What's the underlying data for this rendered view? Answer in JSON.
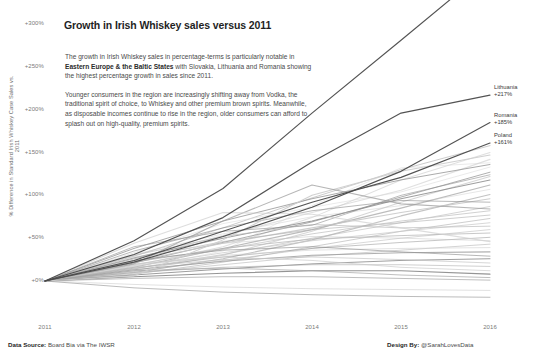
{
  "chart_data": {
    "type": "line",
    "title": "Growth in Irish Whiskey sales versus 2011",
    "xlabel": "",
    "ylabel": "% Difference in Standard Irish Whiskey Case Sales vs. 2011",
    "x": [
      2011,
      2012,
      2013,
      2014,
      2015,
      2016
    ],
    "xticklabels": [
      "2011",
      "2012",
      "2013",
      "2014",
      "2015",
      "2016"
    ],
    "yticklabels": [
      "+0%",
      "+50%",
      "+100%",
      "+150%",
      "+200%",
      "+250%",
      "+300%"
    ],
    "ytickvalues": [
      0,
      50,
      100,
      150,
      200,
      250,
      300
    ],
    "ylim": [
      -25,
      380
    ],
    "xlim": [
      2011,
      2016
    ],
    "grid": false,
    "legend": "series end labels at right",
    "annotation_paragraphs": [
      "The growth in Irish Whiskey sales in percentage-terms is particularly notable in Eastern Europe & the Baltic States with Slovakia, Lithuania and Romania showing the highest percentage growth in sales since 2011.",
      "Younger consumers in the region are increasingly shifting away from Vodka, the traditional spirit of choice, to Whiskey and other premium brown spirits. Meanwhile, as disposable incomes continue to rise in the region, older consumers can afford to splash out on high-quality, premium spirits."
    ],
    "highlight_color": "#4a4a4a",
    "muted_color": "#b8b8b8",
    "series": [
      {
        "name": "Slovakia",
        "label": "Slovakia",
        "value_label": "+367%",
        "highlight": true,
        "values": [
          0,
          47,
          108,
          196,
          281,
          367
        ]
      },
      {
        "name": "Lithuania",
        "label": "Lithuania",
        "value_label": "+217%",
        "highlight": true,
        "values": [
          0,
          31,
          74,
          139,
          196,
          217
        ]
      },
      {
        "name": "Romania",
        "label": "Romania",
        "value_label": "+185%",
        "highlight": true,
        "values": [
          0,
          22,
          52,
          86,
          128,
          185
        ]
      },
      {
        "name": "Poland",
        "label": "Poland",
        "value_label": "+161%",
        "highlight": true,
        "values": [
          0,
          24,
          58,
          92,
          121,
          161
        ]
      },
      {
        "name": "series-05",
        "highlight": false,
        "values": [
          0,
          29,
          62,
          97,
          130,
          158
        ]
      },
      {
        "name": "series-06",
        "highlight": false,
        "values": [
          0,
          18,
          40,
          74,
          118,
          150
        ]
      },
      {
        "name": "series-07",
        "highlight": false,
        "values": [
          0,
          26,
          53,
          80,
          106,
          142
        ]
      },
      {
        "name": "series-08",
        "highlight": false,
        "values": [
          0,
          14,
          35,
          88,
          132,
          138
        ]
      },
      {
        "name": "series-09",
        "highlight": false,
        "values": [
          0,
          33,
          67,
          86,
          104,
          133
        ]
      },
      {
        "name": "series-10",
        "highlight": false,
        "values": [
          0,
          21,
          45,
          69,
          98,
          127
        ]
      },
      {
        "name": "series-11",
        "highlight": false,
        "values": [
          0,
          12,
          30,
          58,
          92,
          122
        ]
      },
      {
        "name": "series-12",
        "highlight": false,
        "values": [
          0,
          27,
          50,
          70,
          96,
          118
        ]
      },
      {
        "name": "series-13",
        "highlight": false,
        "values": [
          0,
          16,
          38,
          60,
          85,
          112
        ]
      },
      {
        "name": "series-14",
        "highlight": false,
        "values": [
          0,
          31,
          55,
          75,
          88,
          107
        ]
      },
      {
        "name": "series-15",
        "highlight": false,
        "values": [
          0,
          10,
          26,
          48,
          76,
          101
        ]
      },
      {
        "name": "series-16",
        "highlight": false,
        "values": [
          0,
          23,
          44,
          62,
          80,
          96
        ]
      },
      {
        "name": "series-17",
        "highlight": false,
        "values": [
          0,
          35,
          62,
          82,
          94,
          92
        ]
      },
      {
        "name": "series-18",
        "highlight": false,
        "values": [
          0,
          14,
          31,
          50,
          68,
          87
        ]
      },
      {
        "name": "series-19",
        "highlight": false,
        "values": [
          0,
          19,
          37,
          55,
          70,
          82
        ]
      },
      {
        "name": "series-20",
        "highlight": false,
        "values": [
          0,
          26,
          46,
          60,
          68,
          77
        ]
      },
      {
        "name": "series-21",
        "highlight": false,
        "values": [
          0,
          8,
          22,
          40,
          58,
          73
        ]
      },
      {
        "name": "series-22",
        "highlight": false,
        "values": [
          0,
          17,
          33,
          47,
          58,
          68
        ]
      },
      {
        "name": "series-23",
        "highlight": false,
        "values": [
          0,
          30,
          52,
          66,
          62,
          64
        ]
      },
      {
        "name": "series-24",
        "highlight": false,
        "values": [
          0,
          11,
          24,
          38,
          50,
          60
        ]
      },
      {
        "name": "series-25",
        "highlight": false,
        "values": [
          0,
          22,
          38,
          49,
          53,
          56
        ]
      },
      {
        "name": "series-26",
        "highlight": false,
        "values": [
          0,
          15,
          28,
          38,
          45,
          51
        ]
      },
      {
        "name": "series-27",
        "highlight": false,
        "values": [
          0,
          28,
          44,
          52,
          50,
          47
        ]
      },
      {
        "name": "series-28",
        "highlight": false,
        "values": [
          0,
          9,
          19,
          29,
          36,
          43
        ]
      },
      {
        "name": "series-29",
        "highlight": false,
        "values": [
          0,
          18,
          30,
          36,
          38,
          39
        ]
      },
      {
        "name": "series-30",
        "highlight": false,
        "values": [
          0,
          13,
          23,
          30,
          33,
          34
        ]
      },
      {
        "name": "series-31",
        "highlight": false,
        "values": [
          0,
          24,
          36,
          40,
          34,
          29
        ]
      },
      {
        "name": "series-32",
        "highlight": false,
        "values": [
          0,
          7,
          14,
          20,
          24,
          26
        ]
      },
      {
        "name": "series-33",
        "highlight": false,
        "values": [
          0,
          16,
          25,
          28,
          25,
          21
        ]
      },
      {
        "name": "series-34",
        "highlight": false,
        "values": [
          0,
          10,
          16,
          19,
          19,
          17
        ]
      },
      {
        "name": "series-35",
        "highlight": false,
        "values": [
          0,
          20,
          28,
          24,
          16,
          12
        ]
      },
      {
        "name": "series-36",
        "highlight": false,
        "values": [
          0,
          5,
          9,
          12,
          12,
          8
        ]
      },
      {
        "name": "series-37",
        "highlight": false,
        "values": [
          0,
          12,
          15,
          12,
          7,
          4
        ]
      },
      {
        "name": "series-38",
        "highlight": false,
        "values": [
          0,
          3,
          5,
          5,
          3,
          1
        ]
      },
      {
        "name": "series-39",
        "highlight": false,
        "values": [
          0,
          -4,
          -7,
          -9,
          -10,
          -11
        ]
      },
      {
        "name": "series-40",
        "highlight": false,
        "values": [
          0,
          -8,
          -13,
          -16,
          -18,
          -19
        ]
      },
      {
        "name": "series-41",
        "highlight": false,
        "values": [
          0,
          38,
          70,
          96,
          118,
          136
        ]
      },
      {
        "name": "series-42",
        "highlight": false,
        "values": [
          0,
          6,
          48,
          100,
          128,
          147
        ]
      },
      {
        "name": "series-43",
        "highlight": false,
        "values": [
          0,
          40,
          58,
          65,
          100,
          124
        ]
      },
      {
        "name": "series-44",
        "highlight": false,
        "values": [
          0,
          20,
          70,
          112,
          90,
          84
        ]
      },
      {
        "name": "series-45",
        "highlight": false,
        "values": [
          0,
          44,
          80,
          78,
          62,
          46
        ]
      }
    ]
  },
  "footer": {
    "data_source_label": "Data Source:",
    "data_source_value": " Board Bia via The IWSR",
    "design_by_label": "Design By:",
    "design_by_value": " @SarahLovesData"
  }
}
